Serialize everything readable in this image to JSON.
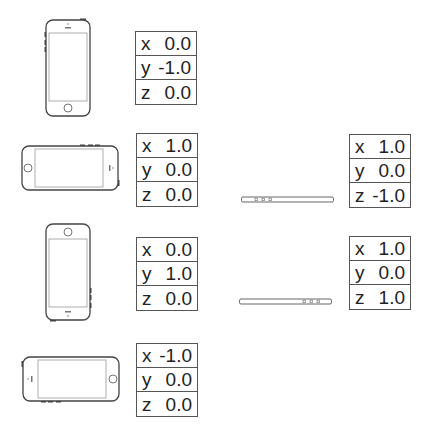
{
  "orientations": [
    {
      "name": "portrait",
      "axes": [
        {
          "label": "x",
          "value": "0.0"
        },
        {
          "label": "y",
          "value": "-1.0"
        },
        {
          "label": "z",
          "value": "0.0"
        }
      ]
    },
    {
      "name": "landscape-left",
      "axes": [
        {
          "label": "x",
          "value": "1.0"
        },
        {
          "label": "y",
          "value": "0.0"
        },
        {
          "label": "z",
          "value": "0.0"
        }
      ]
    },
    {
      "name": "portrait-upside-down",
      "axes": [
        {
          "label": "x",
          "value": "0.0"
        },
        {
          "label": "y",
          "value": "1.0"
        },
        {
          "label": "z",
          "value": "0.0"
        }
      ]
    },
    {
      "name": "landscape-right",
      "axes": [
        {
          "label": "x",
          "value": "-1.0"
        },
        {
          "label": "y",
          "value": "0.0"
        },
        {
          "label": "z",
          "value": "0.0"
        }
      ]
    },
    {
      "name": "face-down",
      "axes": [
        {
          "label": "x",
          "value": "1.0"
        },
        {
          "label": "y",
          "value": "0.0"
        },
        {
          "label": "z",
          "value": "-1.0"
        }
      ]
    },
    {
      "name": "face-up",
      "axes": [
        {
          "label": "x",
          "value": "1.0"
        },
        {
          "label": "y",
          "value": "0.0"
        },
        {
          "label": "z",
          "value": "1.0"
        }
      ]
    }
  ]
}
